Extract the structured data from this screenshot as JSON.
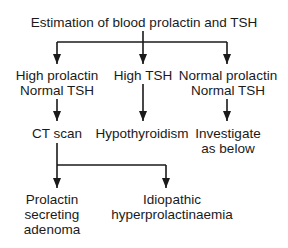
{
  "diagram": {
    "type": "flowchart",
    "root": "Estimation of blood prolactin and TSH",
    "branches": [
      {
        "label_line1": "High prolactin",
        "label_line2": "Normal TSH",
        "next": "CT scan"
      },
      {
        "label_line1": "High TSH",
        "label_line2": "",
        "next": "Hypothyroidism"
      },
      {
        "label_line1": "Normal prolactin",
        "label_line2": "Normal TSH",
        "next_line1": "Investigate",
        "next_line2": "as below"
      }
    ],
    "ct_outcomes": [
      {
        "line1": "Prolactin",
        "line2": "secreting",
        "line3": "adenoma"
      },
      {
        "line1": "Idiopathic",
        "line2": "hyperprolactinaemia"
      }
    ],
    "line_color": "#1a1a1a"
  }
}
